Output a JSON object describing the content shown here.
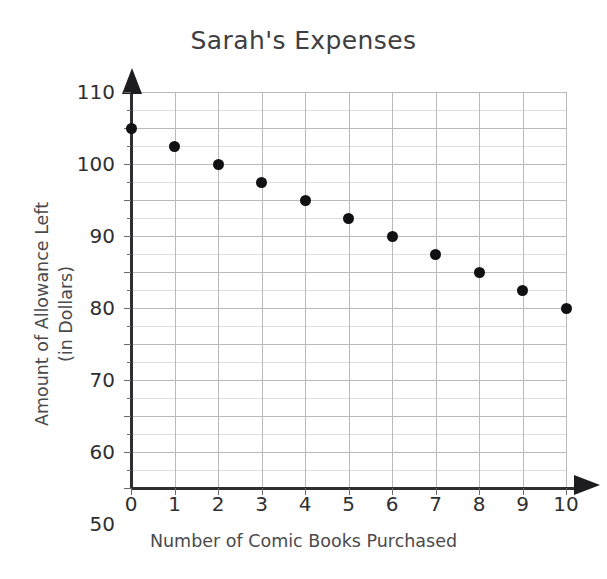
{
  "chart_data": {
    "type": "scatter",
    "title": "Sarah's Expenses",
    "xlabel": "Number of Comic Books Purchased",
    "ylabel": "Amount of Allowance Left\n(in Dollars)",
    "ylabel_line1": "Amount of Allowance Left",
    "ylabel_line2": "(in Dollars)",
    "x": [
      0,
      1,
      2,
      3,
      4,
      5,
      6,
      7,
      8,
      9,
      10
    ],
    "values": [
      100,
      95,
      90,
      85,
      80,
      75,
      70,
      65,
      60,
      55,
      50
    ],
    "points": [
      {
        "x": 0,
        "y": 100
      },
      {
        "x": 1,
        "y": 95
      },
      {
        "x": 2,
        "y": 90
      },
      {
        "x": 3,
        "y": 85
      },
      {
        "x": 4,
        "y": 80
      },
      {
        "x": 5,
        "y": 75
      },
      {
        "x": 6,
        "y": 70
      },
      {
        "x": 7,
        "y": 65
      },
      {
        "x": 8,
        "y": 60
      },
      {
        "x": 9,
        "y": 55
      },
      {
        "x": 10,
        "y": 50
      }
    ],
    "xlim": [
      0,
      10
    ],
    "ylim": [
      0,
      110
    ],
    "xticks": [
      0,
      1,
      2,
      3,
      4,
      5,
      6,
      7,
      8,
      9,
      10
    ],
    "yticks": [
      0,
      10,
      20,
      30,
      40,
      50,
      60,
      70,
      80,
      90,
      100,
      110
    ],
    "xtick_labels": [
      "0",
      "1",
      "2",
      "3",
      "4",
      "5",
      "6",
      "7",
      "8",
      "9",
      "10"
    ],
    "ytick_labels": [
      "0",
      "10",
      "20",
      "30",
      "40",
      "50",
      "60",
      "70",
      "80",
      "90",
      "100",
      "110"
    ],
    "y_minor_ticks": [
      5,
      15,
      25,
      35,
      45,
      55,
      65,
      75,
      85,
      95,
      105
    ],
    "grid": true,
    "grid_minor": true,
    "legend": "none",
    "marker": "filled-circle",
    "marker_color": "#111113",
    "grid_color_major": "#b9b9bb",
    "grid_color_minor": "#dddde0",
    "axis_color": "#2e2e30",
    "text_color": "#2f2f31",
    "background": "#ffffff",
    "x_axis_arrow": true,
    "y_axis_arrow": true
  }
}
